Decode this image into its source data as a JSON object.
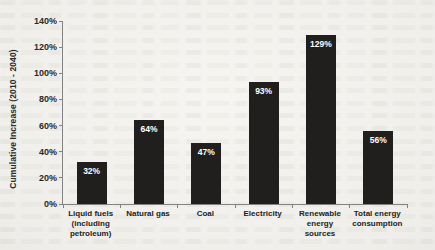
{
  "page": {
    "kind": "scanned book page with embedded chart",
    "background_color": "#f3f2ee"
  },
  "colors": {
    "bar": "#211f1e",
    "bar_value_label": "#ffffff",
    "axis": "#828282",
    "text": "#2a2a2a"
  },
  "chart_data": {
    "type": "bar",
    "title": "",
    "xlabel": "",
    "ylabel": "Cumulative Increase (2010 - 2040)",
    "categories": [
      "Liquid fuels (including petroleum)",
      "Natural gas",
      "Coal",
      "Electricity",
      "Renewable energy sources",
      "Total energy consumption"
    ],
    "values": [
      32,
      64,
      47,
      93,
      129,
      56
    ],
    "value_labels": [
      "32%",
      "64%",
      "47%",
      "93%",
      "129%",
      "56%"
    ],
    "ylim": [
      0,
      140
    ],
    "yticks": [
      0,
      20,
      40,
      60,
      80,
      100,
      120,
      140
    ],
    "ytick_labels": [
      "0%",
      "20%",
      "40%",
      "60%",
      "80%",
      "100%",
      "120%",
      "140%"
    ],
    "grid": false,
    "legend": false
  }
}
